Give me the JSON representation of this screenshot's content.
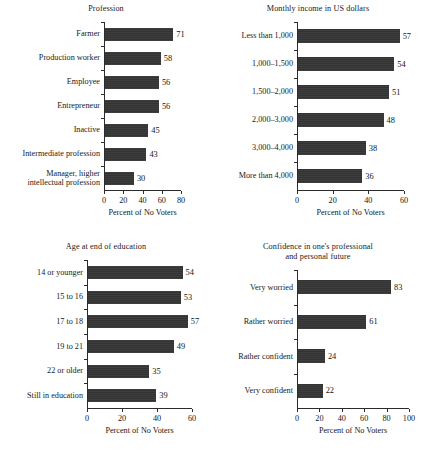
{
  "figure": {
    "axis_title": "Percent of No Voters",
    "bar_color": "#333333",
    "axis_color": "#2b2b2b",
    "background": "#ffffff"
  },
  "chart_data": [
    {
      "id": "profession",
      "type": "bar",
      "orientation": "horizontal",
      "title": "Profession",
      "xlabel": "Percent of No Voters",
      "ylabel": "",
      "xlim": [
        0,
        80
      ],
      "xticks": [
        0,
        20,
        40,
        60,
        80
      ],
      "grid": false,
      "legend": false,
      "categories": [
        "Farmer",
        "Production worker",
        "Employee",
        "Entrepreneur",
        "Inactive",
        "Intermediate profession",
        "Manager, higher\nintellectual profession"
      ],
      "values": [
        71,
        58,
        56,
        56,
        45,
        43,
        30
      ]
    },
    {
      "id": "income",
      "type": "bar",
      "orientation": "horizontal",
      "title": "Monthly income in US dollars",
      "xlabel": "Percent of No Voters",
      "ylabel": "",
      "xlim": [
        0,
        60
      ],
      "xticks": [
        0,
        20,
        40,
        60
      ],
      "grid": false,
      "legend": false,
      "categories": [
        "Less than 1,000",
        "1,000–1,500",
        "1,500–2,000",
        "2,000–3,000",
        "3,000–4,000",
        "More than 4,000"
      ],
      "values": [
        57,
        54,
        51,
        48,
        38,
        36
      ]
    },
    {
      "id": "education",
      "type": "bar",
      "orientation": "horizontal",
      "title": "Age at end of education",
      "xlabel": "Percent of No Voters",
      "ylabel": "",
      "xlim": [
        0,
        60
      ],
      "xticks": [
        0,
        20,
        40,
        60
      ],
      "grid": false,
      "legend": false,
      "categories": [
        "14 or younger",
        "15 to 16",
        "17 to 18",
        "19 to 21",
        "22 or older",
        "Still in education"
      ],
      "values": [
        54,
        53,
        57,
        49,
        35,
        39
      ]
    },
    {
      "id": "confidence",
      "type": "bar",
      "orientation": "horizontal",
      "title": "Confidence in one's professional\nand personal future",
      "xlabel": "Percent of No Voters",
      "ylabel": "",
      "xlim": [
        0,
        100
      ],
      "xticks": [
        0,
        20,
        40,
        60,
        80,
        100
      ],
      "grid": false,
      "legend": false,
      "categories": [
        "Very worried",
        "Rather worried",
        "Rather confident",
        "Very confident"
      ],
      "values": [
        83,
        61,
        24,
        22
      ]
    }
  ]
}
